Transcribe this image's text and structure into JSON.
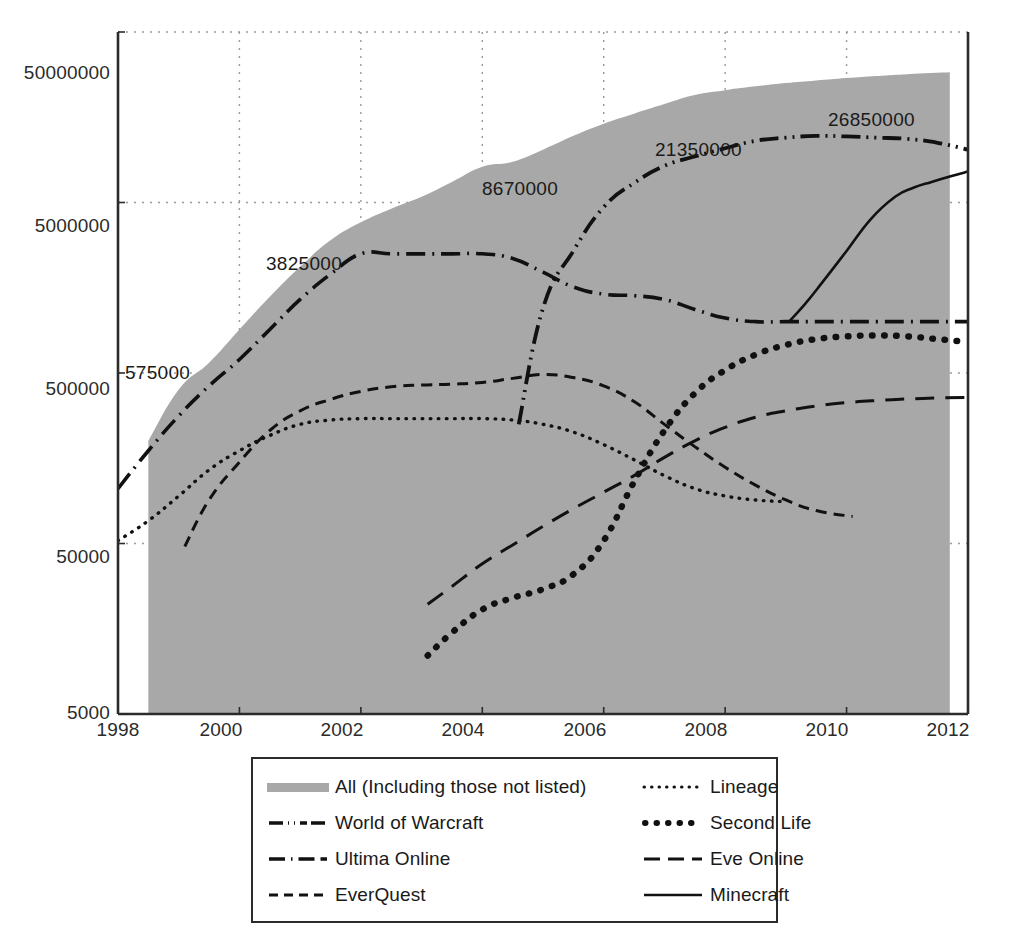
{
  "chart_data": {
    "type": "line",
    "title": "",
    "xlabel": "",
    "ylabel": "",
    "yscale": "log",
    "ylim": [
      5000,
      50000000
    ],
    "xlim": [
      1998,
      2012
    ],
    "grid": true,
    "legend_position": "bottom",
    "y_ticks": [
      "5000",
      "50000",
      "500000",
      "5000000",
      "50000000"
    ],
    "y_tick_values": [
      5000,
      50000,
      500000,
      5000000,
      50000000
    ],
    "x_ticks": [
      "1998",
      "2000",
      "2002",
      "2004",
      "2006",
      "2008",
      "2010",
      "2012"
    ],
    "x_tick_values": [
      1998,
      2000,
      2002,
      2004,
      2006,
      2008,
      2010,
      2012
    ],
    "annotations": [
      {
        "text": "575000",
        "x": 1998.9,
        "y": 575000
      },
      {
        "text": "3825000",
        "x": 2001.3,
        "y": 3825000
      },
      {
        "text": "8670000",
        "x": 2004.1,
        "y": 8670000
      },
      {
        "text": "21350000",
        "x": 2006.9,
        "y": 21350000
      },
      {
        "text": "26850000",
        "x": 2009.6,
        "y": 26850000
      }
    ],
    "series": [
      {
        "name": "All (Including those not listed)",
        "style": "area",
        "color": "#a8a8a8",
        "x": [
          1998.5,
          1999,
          1999.5,
          2000,
          2000.5,
          2001,
          2001.5,
          2002,
          2002.5,
          2003,
          2003.5,
          2004,
          2004.5,
          2005,
          2005.5,
          2006,
          2006.5,
          2007,
          2007.5,
          2008,
          2008.5,
          2009,
          2009.5,
          2010,
          2010.5,
          2011,
          2011.7
        ],
        "y": [
          200000,
          400000,
          575000,
          900000,
          1400000,
          2100000,
          3000000,
          3825000,
          4600000,
          5400000,
          6600000,
          8100000,
          8670000,
          10200000,
          12300000,
          14500000,
          16600000,
          18900000,
          21350000,
          22800000,
          24000000,
          25100000,
          26000000,
          26850000,
          27600000,
          28300000,
          29000000
        ]
      },
      {
        "name": "World of Warcraft",
        "style": "dash-dot-dot",
        "color": "#111111",
        "x": [
          2004.6,
          2005,
          2005.5,
          2006,
          2006.5,
          2007,
          2007.5,
          2008,
          2008.5,
          2009,
          2009.5,
          2010,
          2010.5,
          2011,
          2011.5,
          2012
        ],
        "y": [
          250000,
          1200000,
          2600000,
          4700000,
          6500000,
          8200000,
          9300000,
          10400000,
          11500000,
          12000000,
          12300000,
          12200000,
          12000000,
          11800000,
          11200000,
          10200000
        ]
      },
      {
        "name": "Ultima Online",
        "style": "dash-dot",
        "color": "#111111",
        "x": [
          1998,
          1998.5,
          1999,
          1999.5,
          2000,
          2000.5,
          2001,
          2001.5,
          2002,
          2002.5,
          2003,
          2003.5,
          2004,
          2004.5,
          2005,
          2005.5,
          2006,
          2006.5,
          2007,
          2007.5,
          2008,
          2008.5,
          2009,
          2009.5,
          2010,
          2010.5,
          2011,
          2011.5,
          2012
        ],
        "y": [
          105000,
          175000,
          280000,
          420000,
          600000,
          900000,
          1350000,
          1900000,
          2500000,
          2500000,
          2500000,
          2500000,
          2500000,
          2350000,
          1950000,
          1600000,
          1450000,
          1420000,
          1350000,
          1180000,
          1050000,
          1000000,
          1000000,
          1000000,
          1000000,
          1000000,
          1000000,
          1000000,
          1000000
        ]
      },
      {
        "name": "EverQuest",
        "style": "dashed",
        "color": "#111111",
        "x": [
          1999.1,
          1999.5,
          2000,
          2000.5,
          2001,
          2001.5,
          2002,
          2002.5,
          2003,
          2003.5,
          2004,
          2004.5,
          2005,
          2005.5,
          2006,
          2006.5,
          2007,
          2007.5,
          2008,
          2008.5,
          2009,
          2009.5,
          2010.1
        ],
        "y": [
          48000,
          90000,
          150000,
          230000,
          300000,
          350000,
          390000,
          415000,
          425000,
          430000,
          440000,
          465000,
          490000,
          470000,
          420000,
          340000,
          250000,
          185000,
          140000,
          110000,
          90000,
          78000,
          72000
        ]
      },
      {
        "name": "Lineage",
        "style": "dotted",
        "color": "#111111",
        "x": [
          1998,
          1998.5,
          1999,
          1999.5,
          2000,
          2000.5,
          2001,
          2001.5,
          2002,
          2002.5,
          2003,
          2003.5,
          2004,
          2004.5,
          2005,
          2005.5,
          2006,
          2006.5,
          2007,
          2007.5,
          2008,
          2008.5,
          2009
        ],
        "y": [
          52000,
          68000,
          95000,
          135000,
          175000,
          215000,
          250000,
          265000,
          270000,
          270000,
          270000,
          270000,
          270000,
          265000,
          250000,
          225000,
          190000,
          155000,
          125000,
          105000,
          95000,
          90000,
          88000
        ]
      },
      {
        "name": "Second Life",
        "style": "thick-dotted",
        "color": "#111111",
        "x": [
          2003.1,
          2003.5,
          2004,
          2004.5,
          2005,
          2005.5,
          2006,
          2006.5,
          2007,
          2007.5,
          2008,
          2008.5,
          2009,
          2009.5,
          2010,
          2010.5,
          2011,
          2011.5,
          2012
        ],
        "y": [
          11000,
          15000,
          20500,
          24000,
          27000,
          33000,
          52000,
          115000,
          230000,
          380000,
          520000,
          640000,
          730000,
          790000,
          820000,
          830000,
          820000,
          790000,
          760000
        ]
      },
      {
        "name": "Eve Online",
        "style": "long-dashed",
        "color": "#111111",
        "x": [
          2003.1,
          2003.5,
          2004,
          2004.5,
          2005,
          2005.5,
          2006,
          2006.5,
          2007,
          2007.5,
          2008,
          2008.5,
          2009,
          2009.5,
          2010,
          2010.5,
          2011,
          2011.5,
          2012
        ],
        "y": [
          22000,
          28000,
          38000,
          49000,
          63000,
          80000,
          100000,
          125000,
          160000,
          200000,
          240000,
          275000,
          300000,
          320000,
          335000,
          345000,
          352000,
          357000,
          360000
        ]
      },
      {
        "name": "Minecraft",
        "style": "solid",
        "color": "#111111",
        "x": [
          2009.05,
          2009.3,
          2009.6,
          2010,
          2010.4,
          2010.8,
          2011.1,
          2011.4,
          2011.7,
          2012
        ],
        "y": [
          1000000,
          1250000,
          1700000,
          2600000,
          4000000,
          5400000,
          6100000,
          6600000,
          7100000,
          7600000
        ]
      }
    ]
  },
  "legend": {
    "entries": [
      {
        "label": "All (Including those not listed)",
        "style": "area"
      },
      {
        "label": "Lineage",
        "style": "dotted"
      },
      {
        "label": "World of Warcraft",
        "style": "dash-dot-dot"
      },
      {
        "label": "Second Life",
        "style": "thick-dotted"
      },
      {
        "label": "Ultima Online",
        "style": "dash-dot"
      },
      {
        "label": "Eve Online",
        "style": "long-dashed"
      },
      {
        "label": "EverQuest",
        "style": "dashed"
      },
      {
        "label": "Minecraft",
        "style": "solid"
      }
    ]
  },
  "colors": {
    "area_fill": "#a8a8a8",
    "line": "#111111",
    "axis": "#2b2b2b",
    "grid": "#9a9a9a",
    "background": "#ffffff"
  }
}
